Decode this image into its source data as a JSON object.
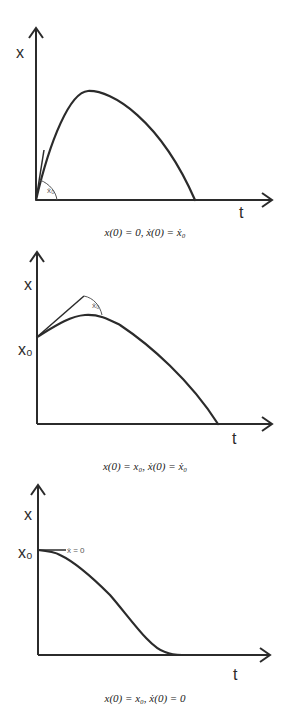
{
  "panels": [
    {
      "id": "ballistic-from-zero",
      "y_axis_label": "x",
      "x_axis_label": "t",
      "tangent_label": "ẋ₀",
      "caption": "x(0) = 0, ẋ(0) = ẋ₀"
    },
    {
      "id": "ballistic-from-x0",
      "y_axis_label": "x",
      "x_axis_label": "t",
      "y_tick_label": "x₀",
      "tangent_label": "ẋ₀",
      "caption": "x(0) = x₀, ẋ(0) = ẋ₀"
    },
    {
      "id": "drop-from-rest",
      "y_axis_label": "x",
      "x_axis_label": "t",
      "y_tick_label": "x₀",
      "tangent_label": "ẋ = 0",
      "caption": "x(0) = x₀, ẋ(0) = 0"
    }
  ],
  "colors": {
    "ink": "#2b2b2b",
    "background": "#ffffff"
  }
}
